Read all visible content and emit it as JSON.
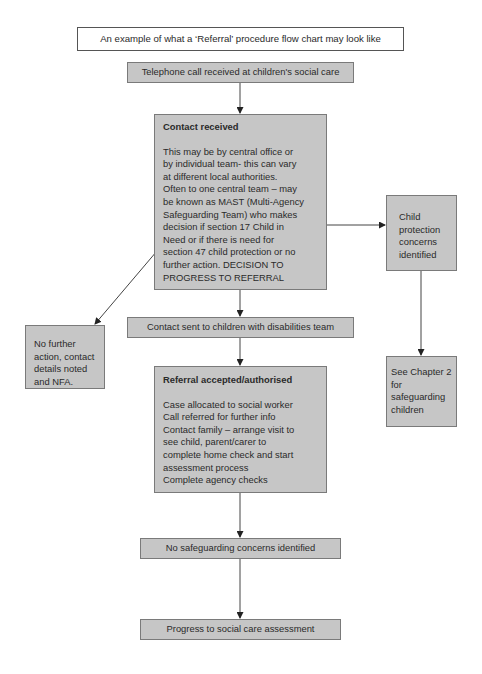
{
  "title": "An example of what a ‘Referral’ procedure flow chart may look like",
  "nodes": {
    "telephone": {
      "label": "Telephone call received at children's social care"
    },
    "contact_received": {
      "heading": "Contact received",
      "lines": [
        "This may be by central office or",
        "by individual team- this can vary",
        "at different local authorities.",
        "Often to one central team – may",
        "be known as MAST (Multi-Agency",
        "Safeguarding Team) who makes",
        "decision if section 17 Child in",
        "Need or if there is need for",
        "section 47 child protection or no",
        "further action. DECISION TO",
        "PROGRESS TO REFERRAL"
      ]
    },
    "child_protection": {
      "lines": [
        "Child",
        "protection",
        "concerns",
        "identified"
      ]
    },
    "no_further_action": {
      "lines": [
        "No further",
        "action, contact",
        "details noted",
        "and NFA."
      ]
    },
    "contact_sent": {
      "label": "Contact sent to children with disabilities team"
    },
    "see_chapter": {
      "lines": [
        "See Chapter 2",
        "for",
        "safeguarding",
        "children"
      ]
    },
    "referral_accepted": {
      "heading": "Referral accepted/authorised",
      "lines": [
        "Case allocated to social worker",
        "Call referred for further info",
        "Contact family – arrange visit to",
        "see child, parent/carer to",
        "complete home check and start",
        "assessment process",
        "Complete agency checks"
      ]
    },
    "no_safeguarding": {
      "label": "No safeguarding concerns identified"
    },
    "progress": {
      "label": "Progress to social care assessment"
    }
  },
  "colors": {
    "box_fill": "#c6c6c6",
    "box_border": "#7a7a7a",
    "arrow": "#333333"
  }
}
